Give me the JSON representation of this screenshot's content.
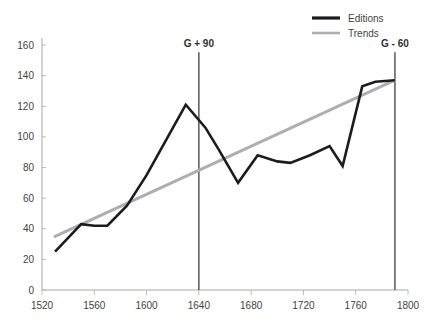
{
  "chart_data": {
    "type": "line",
    "title": "",
    "xlabel": "",
    "ylabel": "",
    "xlim": [
      1520,
      1800
    ],
    "ylim": [
      0,
      160
    ],
    "xticks": [
      1520,
      1560,
      1600,
      1640,
      1680,
      1720,
      1760,
      1800
    ],
    "yticks": [
      0,
      20,
      40,
      60,
      80,
      100,
      120,
      140,
      160
    ],
    "grid": false,
    "legend_position": "top-right",
    "series": [
      {
        "name": "Editions",
        "color": "#1c1c20",
        "x": [
          1530,
          1550,
          1560,
          1570,
          1585,
          1600,
          1615,
          1630,
          1645,
          1655,
          1670,
          1685,
          1700,
          1710,
          1725,
          1740,
          1750,
          1765,
          1775,
          1790
        ],
        "values": [
          25,
          43,
          42,
          42,
          55,
          75,
          98,
          121,
          106,
          92,
          70,
          88,
          84,
          83,
          88,
          94,
          81,
          133,
          136,
          137
        ]
      },
      {
        "name": "Trends",
        "color": "#aeaeb2",
        "x": [
          1530,
          1790
        ],
        "values": [
          35,
          137
        ]
      }
    ],
    "annotations": [
      {
        "label": "G + 90",
        "x": 1640,
        "label_y": 150
      },
      {
        "label": "G - 60",
        "x": 1790,
        "label_y": 150
      }
    ]
  },
  "legend": {
    "items": [
      {
        "label": "Editions",
        "color": "#1c1c20"
      },
      {
        "label": "Trends",
        "color": "#aeaeb2"
      }
    ]
  },
  "top_fragment": {
    "text": ""
  }
}
